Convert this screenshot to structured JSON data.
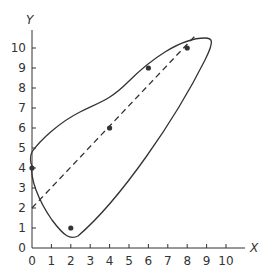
{
  "chart_data": {
    "type": "scatter",
    "title": "",
    "xlabel": "X",
    "ylabel": "Y",
    "xlim": [
      0,
      10
    ],
    "ylim": [
      0,
      10
    ],
    "x_ticks": [
      "0",
      "1",
      "2",
      "3",
      "4",
      "5",
      "6",
      "7",
      "8",
      "9",
      "10"
    ],
    "y_ticks": [
      "0",
      "1",
      "2",
      "3",
      "4",
      "5",
      "6",
      "7",
      "8",
      "9",
      "10"
    ],
    "grid": false,
    "legend": null,
    "series": [
      {
        "name": "points",
        "x": [
          0,
          2,
          4,
          6,
          8
        ],
        "y": [
          4,
          1,
          6,
          9,
          10
        ]
      }
    ],
    "fit_line": {
      "style": "dashed",
      "x": [
        0,
        8.4
      ],
      "y": [
        2,
        10.6
      ],
      "slope": 1,
      "intercept": 2
    },
    "enclosing_curve": {
      "style": "solid",
      "description": "closed convex hull-like curve around points"
    }
  },
  "colors": {
    "ink": "#333333",
    "background": "#ffffff"
  }
}
